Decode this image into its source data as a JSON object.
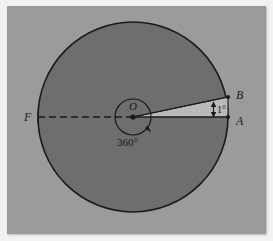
{
  "figure": {
    "background_color": "#f2f2f2",
    "panel_color": "#9b9b9b",
    "circle_fill": "#6e6e6e",
    "sector_fill": "#b4b4b4",
    "stroke_color": "#1a1a1a"
  },
  "labels": {
    "center": "O",
    "full_turn": "360°",
    "point_f": "F",
    "point_a": "A",
    "point_b": "B",
    "angle": "1°"
  },
  "geometry": {
    "circle_center_x": 133,
    "circle_center_y": 117,
    "circle_radius": 95,
    "inner_circle_radius": 18,
    "point_a_x": 228,
    "point_a_y": 117,
    "point_b_x": 228,
    "point_b_y": 97,
    "point_f_x": 38,
    "point_f_y": 117,
    "sector_angle_degrees": 1,
    "full_turn_degrees": 360
  },
  "elements": {
    "dashed_diameter": "dashed line from F through center O to A",
    "rotation_arrow": "arrowhead indicating full 360 degree rotation at center",
    "angle_dimension": "double-headed arrow between radius OB and radius OA"
  }
}
